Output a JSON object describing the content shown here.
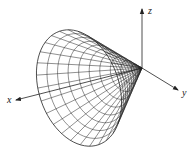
{
  "figure": {
    "axes": {
      "x_label": "x",
      "y_label": "y",
      "z_label": "z"
    },
    "geometry": {
      "origin": [
        142,
        68
      ],
      "x_axis_end": [
        16,
        100
      ],
      "y_axis_end": [
        178,
        90
      ],
      "z_axis_end": [
        142,
        9
      ],
      "base_center": [
        79,
        88
      ],
      "base_semi_major": 60,
      "base_semi_minor": 40,
      "base_rotation_deg": 71,
      "rings": 10,
      "generators": 28
    },
    "colors": {
      "line": "#222222",
      "background": "#ffffff"
    }
  }
}
